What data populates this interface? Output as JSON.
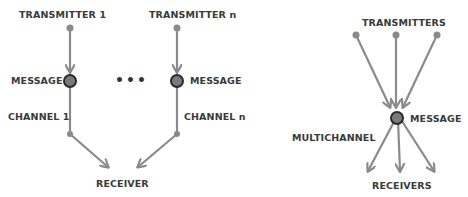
{
  "colors": {
    "arrow": "#8a8a8a",
    "message_node_fill": "#7a7a7a",
    "message_node_stroke": "#2a2a2a",
    "label": "#3a3a3a"
  },
  "left_diagram": {
    "transmitter_1": "TRANSMITTER 1",
    "transmitter_n": "TRANSMITTER n",
    "message_left": "MESSAGE",
    "message_right": "MESSAGE",
    "ellipsis": "•••",
    "channel_1": "CHANNEL 1",
    "channel_n": "CHANNEL n",
    "receiver": "RECEIVER"
  },
  "right_diagram": {
    "transmitters": "TRANSMITTERS",
    "message": "MESSAGE",
    "multichannel": "MULTICHANNEL",
    "receivers": "RECEIVERS"
  }
}
